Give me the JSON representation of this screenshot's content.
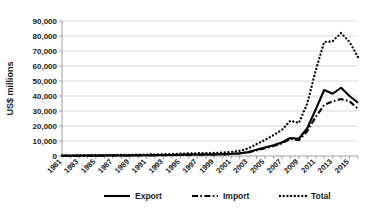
{
  "chart_data": {
    "type": "line",
    "title": "",
    "xlabel": "",
    "ylabel": "US$ millions",
    "ylim": [
      0,
      90000
    ],
    "xlim": [
      1981,
      2016
    ],
    "grid": true,
    "legend_position": "bottom",
    "y_ticks": [
      "0",
      "10,000",
      "20,000",
      "30,000",
      "40,000",
      "50,000",
      "60,000",
      "70,000",
      "80,000",
      "90,000"
    ],
    "y_tick_values": [
      0,
      10000,
      20000,
      30000,
      40000,
      50000,
      60000,
      70000,
      80000,
      90000
    ],
    "x_tick_labels": [
      "1981",
      "1983",
      "1985",
      "1987",
      "1989",
      "1991",
      "1993",
      "1995",
      "1997",
      "1999",
      "2001",
      "2003",
      "2005",
      "2007",
      "2009",
      "2011",
      "2013",
      "2015"
    ],
    "x": [
      1981,
      1982,
      1983,
      1984,
      1985,
      1986,
      1987,
      1988,
      1989,
      1990,
      1991,
      1992,
      1993,
      1994,
      1995,
      1996,
      1997,
      1998,
      1999,
      2000,
      2001,
      2002,
      2003,
      2004,
      2005,
      2006,
      2007,
      2008,
      2009,
      2010,
      2011,
      2012,
      2013,
      2014,
      2015,
      2016
    ],
    "series": [
      {
        "name": "Export",
        "style": "solid",
        "color": "#000000",
        "values": [
          180,
          200,
          220,
          250,
          280,
          300,
          340,
          380,
          420,
          450,
          500,
          560,
          620,
          700,
          800,
          900,
          980,
          1000,
          1050,
          1200,
          1400,
          1800,
          2600,
          4100,
          5600,
          7200,
          9000,
          12000,
          11500,
          18500,
          31000,
          44000,
          41500,
          45500,
          40000,
          35500
        ]
      },
      {
        "name": "Import",
        "style": "dashed",
        "color": "#000000",
        "values": [
          150,
          170,
          190,
          210,
          240,
          260,
          290,
          320,
          360,
          390,
          430,
          480,
          540,
          610,
          690,
          780,
          860,
          900,
          950,
          1100,
          1300,
          1700,
          2400,
          3800,
          5200,
          6700,
          8400,
          11500,
          10500,
          16500,
          26000,
          34000,
          36500,
          38000,
          36500,
          31500
        ]
      },
      {
        "name": "Total",
        "style": "dotted",
        "color": "#000000",
        "values": [
          330,
          370,
          410,
          460,
          520,
          560,
          630,
          700,
          780,
          840,
          930,
          1040,
          1160,
          1310,
          1490,
          1680,
          1840,
          1900,
          2000,
          2300,
          2700,
          3500,
          5000,
          7900,
          10800,
          13900,
          17400,
          23500,
          22000,
          35000,
          57000,
          76000,
          76500,
          82000,
          76000,
          66000
        ]
      }
    ],
    "legend": [
      {
        "label": "Export",
        "style": "solid"
      },
      {
        "label": "Import",
        "style": "dashed"
      },
      {
        "label": "Total",
        "style": "dotted"
      }
    ]
  }
}
